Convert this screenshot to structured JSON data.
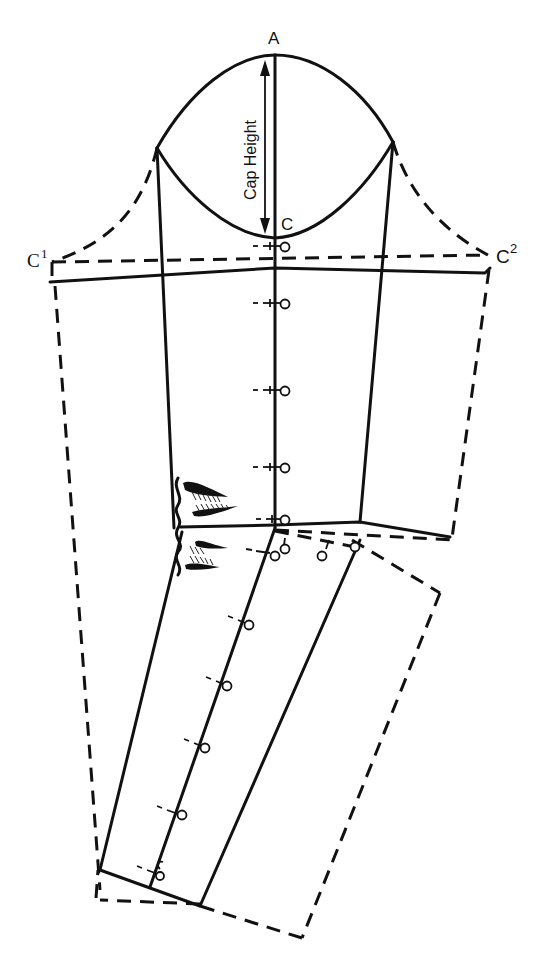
{
  "diagram": {
    "labels": {
      "A": "A",
      "C": "C",
      "cap_height": "Cap Height",
      "c1_base": "C",
      "c1_sup": "1",
      "c2_base": "C",
      "c2_sup": "2"
    },
    "colors": {
      "ink": "#111111",
      "paper": "#ffffff"
    },
    "points": {
      "A": [
        275,
        55
      ],
      "C": [
        275,
        238
      ],
      "cap_left": [
        157,
        148
      ],
      "cap_right": [
        393,
        142
      ],
      "C1": [
        50,
        262
      ],
      "C2": [
        490,
        255
      ],
      "elbow_center": [
        275,
        525
      ]
    },
    "pins_upper_arm": [
      {
        "y": 246
      },
      {
        "y": 303
      },
      {
        "y": 390
      },
      {
        "y": 467
      },
      {
        "y": 519
      }
    ],
    "pins_forearm": [
      {
        "x": 249,
        "y": 625
      },
      {
        "x": 227,
        "y": 686
      },
      {
        "x": 205,
        "y": 748
      },
      {
        "x": 182,
        "y": 815
      },
      {
        "x": 160,
        "y": 875
      }
    ],
    "elbow_darts_count": 4
  }
}
